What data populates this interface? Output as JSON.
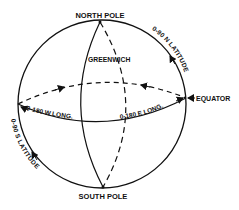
{
  "diagram": {
    "labels": {
      "north_pole": "NORTH POLE",
      "south_pole": "SOUTH POLE",
      "greenwich": "GREENWICH",
      "equator": "EQUATOR",
      "west_longitude": "0-180 W LONG.",
      "east_longitude": "0-180 E LONG.",
      "north_latitude": "0-90 N LATITUDE",
      "south_latitude": "0-90 S LATITUDE"
    },
    "colors": {
      "ink": "#111111",
      "background": "#ffffff"
    }
  }
}
